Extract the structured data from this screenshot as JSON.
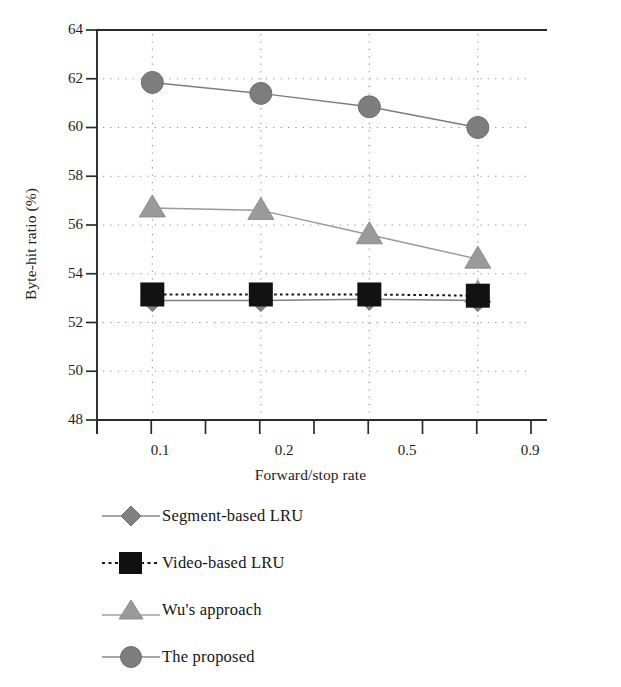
{
  "chart_data": {
    "type": "line",
    "title": "",
    "xlabel": "Forward/stop rate",
    "ylabel": "Byte-hit ratio (%)",
    "categories": [
      "0.1",
      "0.2",
      "0.5",
      "0.9"
    ],
    "ylim": [
      48,
      64
    ],
    "yticks": [
      "48",
      "50",
      "52",
      "54",
      "56",
      "58",
      "60",
      "62",
      "64"
    ],
    "grid": "dotted",
    "legend_position": "below-plot",
    "series": [
      {
        "name": "Segment-based LRU",
        "marker": "diamond",
        "color": "#808080",
        "line": "solid",
        "values": [
          52.9,
          52.9,
          52.95,
          52.9
        ]
      },
      {
        "name": "Video-based LRU",
        "marker": "square",
        "color": "#121212",
        "line": "dotted",
        "values": [
          53.15,
          53.15,
          53.15,
          53.1
        ]
      },
      {
        "name": "Wu's approach",
        "marker": "triangle",
        "color": "#9a9a9a",
        "line": "solid",
        "values": [
          56.7,
          56.6,
          55.6,
          54.6
        ]
      },
      {
        "name": "The proposed",
        "marker": "circle",
        "color": "#7d7d7d",
        "line": "solid",
        "values": [
          61.85,
          61.4,
          60.85,
          60.0
        ]
      }
    ],
    "extra_markers": [
      {
        "series": "Wu's approach",
        "category": "0.9",
        "value": 53.2,
        "note": "triangle partially behind square marker"
      }
    ]
  },
  "legend": {
    "items": [
      {
        "label": "Segment-based LRU",
        "marker": "diamond-icon"
      },
      {
        "label": "Video-based LRU",
        "marker": "square-icon"
      },
      {
        "label": "Wu's approach",
        "marker": "triangle-icon"
      },
      {
        "label": "The proposed",
        "marker": "circle-icon"
      }
    ]
  },
  "axes": {
    "x_title": "Forward/stop rate",
    "y_title": "Byte-hit ratio (%)",
    "x_ticks": [
      "0.1",
      "0.2",
      "0.5",
      "0.9"
    ],
    "y_ticks": [
      "64",
      "62",
      "60",
      "58",
      "56",
      "54",
      "52",
      "50",
      "48"
    ]
  }
}
